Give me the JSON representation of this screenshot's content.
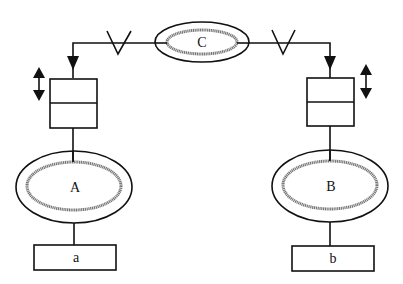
{
  "diagram": {
    "nodes": {
      "A": {
        "label": "A",
        "type": "double-ellipse"
      },
      "B": {
        "label": "B",
        "type": "double-ellipse"
      },
      "C": {
        "label": "C",
        "type": "double-ellipse"
      },
      "a": {
        "label": "a",
        "type": "rectangle"
      },
      "b": {
        "label": "b",
        "type": "rectangle"
      }
    },
    "stacks": [
      {
        "id": "left-stack",
        "cells": 2,
        "adjust": "up-down"
      },
      {
        "id": "right-stack",
        "cells": 2,
        "adjust": "up-down"
      }
    ],
    "connections": [
      {
        "from": "C",
        "to": "left-stack",
        "marker": "V",
        "arrow": "down"
      },
      {
        "from": "C",
        "to": "right-stack",
        "marker": "V",
        "arrow": "down"
      },
      {
        "from": "left-stack",
        "to": "A"
      },
      {
        "from": "right-stack",
        "to": "B"
      },
      {
        "from": "A",
        "to": "a"
      },
      {
        "from": "B",
        "to": "b"
      }
    ],
    "colors": {
      "stroke": "#111111",
      "inner_ring": "#777777",
      "background": "#ffffff"
    }
  }
}
